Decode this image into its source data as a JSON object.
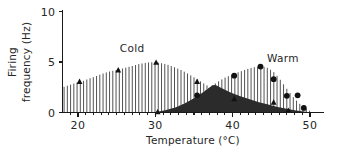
{
  "chart_data": {
    "type": "area",
    "title": "",
    "xlabel": "Temperature (°C)",
    "ylabel": "Firing frequency (Hz)",
    "ylabel_line1": "Firing",
    "ylabel_line2": "frequency (Hz)",
    "xlim": [
      18,
      51
    ],
    "ylim": [
      0,
      10
    ],
    "xticks": [
      20,
      30,
      40,
      50
    ],
    "xtick_labels": [
      "20",
      "30",
      "40",
      "50"
    ],
    "yticks": [
      0,
      5,
      10
    ],
    "ytick_labels": [
      "0",
      "5",
      "10"
    ],
    "grid": false,
    "legend_position": "inline-annotation",
    "annotations": [
      {
        "text": "Cold",
        "x": 27.0,
        "y": 6.0
      },
      {
        "text": "Warm",
        "x": 46.5,
        "y": 5.0
      }
    ],
    "series": [
      {
        "name": "Cold",
        "style": "vertical-hatch-fill",
        "marker": "triangle",
        "x": [
          18.2,
          19.0,
          19.8,
          20.6,
          21.4,
          22.2,
          23.0,
          23.8,
          24.6,
          25.4,
          26.2,
          27.0,
          27.8,
          28.6,
          29.4,
          30.2,
          31.0,
          31.8,
          32.6,
          33.4,
          34.2,
          35.0,
          35.8,
          36.6,
          37.4,
          38.2,
          39.0,
          39.8,
          40.6,
          41.4,
          42.2,
          43.0,
          43.8,
          44.6,
          45.4,
          46.2,
          47.0,
          47.8,
          48.6,
          49.4
        ],
        "values": [
          2.55,
          2.75,
          2.95,
          3.1,
          3.35,
          3.55,
          3.8,
          4.0,
          4.15,
          4.28,
          4.45,
          4.6,
          4.78,
          4.9,
          4.98,
          4.95,
          4.85,
          4.68,
          4.45,
          4.18,
          3.85,
          3.48,
          3.1,
          2.72,
          2.35,
          2.0,
          1.7,
          1.42,
          1.18,
          0.98,
          0.8,
          0.65,
          0.52,
          0.4,
          0.3,
          0.22,
          0.15,
          0.1,
          0.06,
          0.03
        ],
        "marker_points": [
          {
            "x": 20.2,
            "y": 3.05
          },
          {
            "x": 25.2,
            "y": 4.2
          },
          {
            "x": 30.1,
            "y": 4.95
          },
          {
            "x": 30.3,
            "y": 0.05
          },
          {
            "x": 35.4,
            "y": 3.05
          },
          {
            "x": 40.2,
            "y": 1.35
          },
          {
            "x": 45.3,
            "y": 1.0
          },
          {
            "x": 47.2,
            "y": 0.2
          }
        ]
      },
      {
        "name": "Warm",
        "style": "vertical-hatch-fill",
        "marker": "circle",
        "x": [
          30.2,
          31.0,
          31.8,
          32.6,
          33.4,
          34.2,
          35.0,
          35.8,
          36.6,
          37.4,
          38.2,
          39.0,
          39.8,
          40.6,
          41.4,
          42.2,
          43.0,
          43.8,
          44.6,
          45.4,
          46.2,
          47.0,
          47.8,
          48.6,
          49.4,
          50.0
        ],
        "values": [
          0.05,
          0.15,
          0.3,
          0.5,
          0.75,
          1.05,
          1.4,
          1.8,
          2.25,
          2.7,
          3.1,
          3.45,
          3.72,
          3.95,
          4.18,
          4.38,
          4.52,
          4.58,
          4.4,
          3.95,
          3.2,
          2.35,
          1.55,
          0.9,
          0.42,
          0.15
        ],
        "marker_points": [
          {
            "x": 35.4,
            "y": 1.7
          },
          {
            "x": 40.2,
            "y": 3.65
          },
          {
            "x": 43.6,
            "y": 4.55
          },
          {
            "x": 45.3,
            "y": 3.3
          },
          {
            "x": 47.0,
            "y": 1.65
          },
          {
            "x": 48.4,
            "y": 1.7
          },
          {
            "x": 49.2,
            "y": 0.45
          }
        ]
      },
      {
        "name": "Warm-overlap-solid",
        "style": "solid-dark-fill",
        "marker": "none",
        "x": [
          30.2,
          31.4,
          32.6,
          33.8,
          35.0,
          36.2,
          37.4,
          37.8,
          38.6,
          39.8,
          41.0,
          42.2,
          43.4,
          44.6,
          45.8,
          47.0,
          48.2,
          49.4,
          50.0
        ],
        "values": [
          0.05,
          0.25,
          0.5,
          0.9,
          1.4,
          2.0,
          2.7,
          2.72,
          2.4,
          1.95,
          1.6,
          1.3,
          1.02,
          0.78,
          0.55,
          0.36,
          0.2,
          0.08,
          0.02
        ]
      }
    ]
  }
}
